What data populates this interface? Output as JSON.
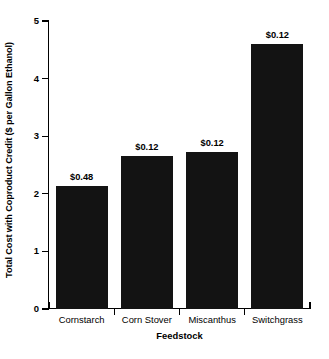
{
  "chart_data": {
    "type": "bar",
    "title": "",
    "xlabel": "Feedstock",
    "ylabel": "Total Cost with Coproduct Credit ($ per Gallon Ethanol)",
    "categories": [
      "Cornstarch",
      "Corn Stover",
      "Miscanthus",
      "Switchgrass"
    ],
    "values": [
      2.14,
      2.65,
      2.73,
      4.6
    ],
    "point_labels": [
      "$0.48",
      "$0.12",
      "$0.12",
      "$0.12"
    ],
    "ylim": [
      0,
      5
    ],
    "yticks": [
      0,
      1,
      2,
      3,
      4,
      5
    ],
    "ytick_labels": [
      "0",
      "1",
      "2",
      "3",
      "4",
      "5"
    ],
    "grid": false,
    "legend": null,
    "bar_color": "#131313"
  }
}
